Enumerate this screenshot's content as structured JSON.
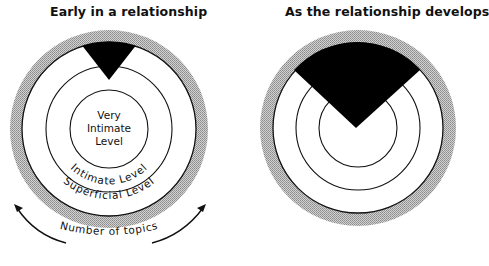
{
  "panels": {
    "left": {
      "title": "Early in a relationship",
      "levels": {
        "inner_line1": "Very",
        "inner_line2": "Intimate",
        "inner_line3": "Level",
        "middle": "Intimate Level",
        "outer": "Superficial Level"
      }
    },
    "right": {
      "title": "As the relationship develops"
    }
  },
  "axis": {
    "label": "Number of topics"
  },
  "colors": {
    "ring_gray": "#b3b3b3",
    "wedge": "#000000",
    "line": "#111111"
  }
}
